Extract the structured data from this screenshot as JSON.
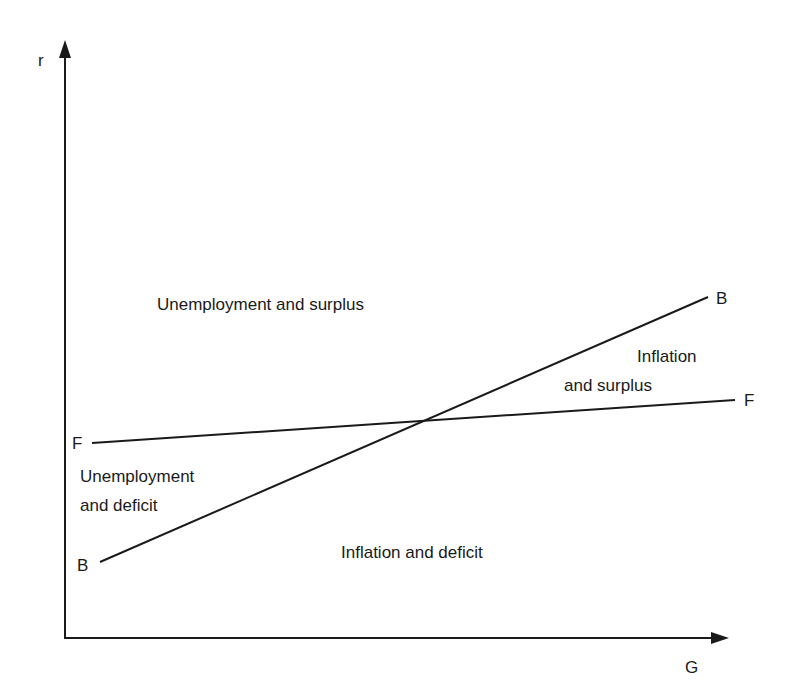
{
  "axes": {
    "y_label": "r",
    "x_label": "G"
  },
  "curves": {
    "bb": {
      "start_label": "B",
      "end_label": "B"
    },
    "ff": {
      "start_label": "F",
      "end_label": "F"
    }
  },
  "regions": {
    "unemployment_surplus": "Unemployment and surplus",
    "inflation_surplus_line1": "Inflation",
    "inflation_surplus_line2": "and surplus",
    "unemployment_deficit_line1": "Unemployment",
    "unemployment_deficit_line2": "and deficit",
    "inflation_deficit": "Inflation and deficit"
  },
  "colors": {
    "line": "#1a1a1a",
    "background": "#ffffff"
  }
}
